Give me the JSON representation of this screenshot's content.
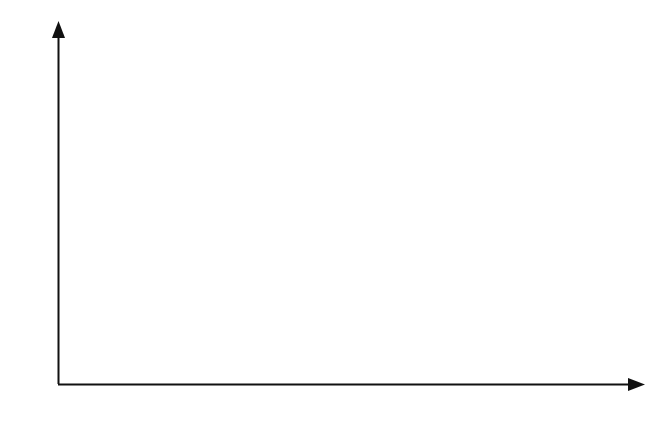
{
  "figure": {
    "background_color": "#ffffff",
    "line_color": "#111111",
    "fill_color": "#c9c9c9",
    "y_axis_name_function": "f",
    "y_axis_name_subscript": "x",
    "y_axis_name_arg": "(α)",
    "x_axis_name": "α"
  },
  "chart_data": {
    "type": "area",
    "title": "",
    "subtitle": "",
    "xlabel": "α",
    "ylabel": "f_x(α)",
    "grid": false,
    "legend": null,
    "xlim": [
      0,
      67
    ],
    "ylim": [
      0,
      0.0445
    ],
    "x_ticks": [
      0,
      10,
      20,
      30,
      40,
      50,
      60
    ],
    "x_tick_labels": [
      "0",
      "",
      "",
      "30",
      "",
      "",
      "60"
    ],
    "y_ticks": [
      0.01,
      0.02,
      0.03,
      0.04
    ],
    "y_tick_labels": [
      ".01",
      ".02",
      ".03",
      ".04"
    ],
    "curve": {
      "name": "normal density",
      "distribution": "normal",
      "mean": 35,
      "std_dev": 10,
      "peak_x": 35,
      "peak_y": 0.0399,
      "x": [
        0,
        2.5,
        5,
        7.5,
        10,
        12.5,
        15,
        17.5,
        20,
        22.5,
        25,
        27.5,
        30,
        32.5,
        35,
        37.5,
        40,
        42.5,
        45,
        47.5,
        50,
        52.5,
        55,
        57.5,
        60,
        62.5,
        65,
        67
      ],
      "y": [
        0.00076,
        0.00123,
        0.00195,
        0.00298,
        0.0044,
        0.00627,
        0.00863,
        0.01146,
        0.01468,
        0.01811,
        0.02157,
        0.02477,
        0.02742,
        0.02925,
        0.02989,
        0.02925,
        0.02742,
        0.02477,
        0.02157,
        0.01811,
        0.01468,
        0.01146,
        0.00863,
        0.00627,
        0.0044,
        0.00298,
        0.00195,
        0.00148
      ]
    },
    "shaded_region": {
      "x_start": 37.5,
      "x_end": 51,
      "y_at_x_start": 0.0385,
      "y_at_x_end": 0.0095,
      "fill": "#c9c9c9",
      "outline": "#111111"
    }
  }
}
